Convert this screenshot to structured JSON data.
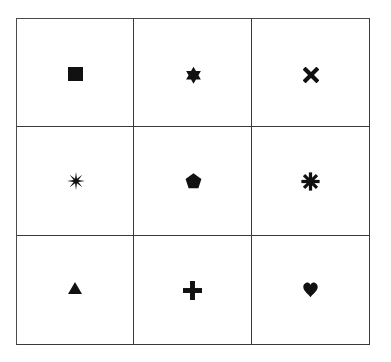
{
  "grid": {
    "rows": 3,
    "cols": 3,
    "line_color": "#3a3a3a",
    "symbol_color": "#111111",
    "cells": [
      {
        "row": 0,
        "col": 0,
        "symbol": "square",
        "label": "Square"
      },
      {
        "row": 0,
        "col": 1,
        "symbol": "six-pointed-star",
        "label": "Six-pointed star"
      },
      {
        "row": 0,
        "col": 2,
        "symbol": "heavy-x",
        "label": "Heavy X"
      },
      {
        "row": 1,
        "col": 0,
        "symbol": "eight-pointed-star",
        "label": "Eight-pointed star"
      },
      {
        "row": 1,
        "col": 1,
        "symbol": "pentagon",
        "label": "Pentagon"
      },
      {
        "row": 1,
        "col": 2,
        "symbol": "heavy-asterisk",
        "label": "Heavy asterisk"
      },
      {
        "row": 2,
        "col": 0,
        "symbol": "triangle",
        "label": "Triangle"
      },
      {
        "row": 2,
        "col": 1,
        "symbol": "heavy-plus",
        "label": "Heavy plus"
      },
      {
        "row": 2,
        "col": 2,
        "symbol": "heart",
        "label": "Heart"
      }
    ]
  }
}
